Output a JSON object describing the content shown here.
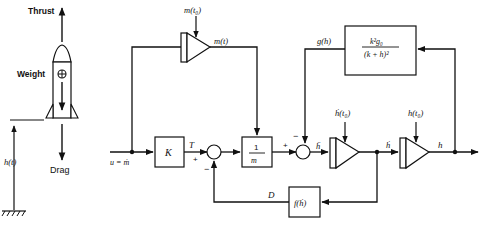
{
  "rocket": {
    "thrust_label": "Thrust",
    "weight_label": "Weight",
    "drag_label": "Drag",
    "height_label": "h(t)",
    "cg_symbol": "⊕"
  },
  "blocks": {
    "mass_integrator": {
      "ic_label": "m(t₀)",
      "output_label": "m(t)"
    },
    "gain_k": {
      "label": "K",
      "output_label": "T"
    },
    "inv_mass": {
      "numerator": "1",
      "denominator": "m"
    },
    "gravity": {
      "numerator": "k²g₀",
      "denominator": "(k + h)²",
      "output_label": "g(h)"
    },
    "velocity_integrator": {
      "ic_label": "ḣ(t₀)",
      "input_label": "ḧ",
      "output_label": "ḣ"
    },
    "height_integrator": {
      "ic_label": "h(t₀)",
      "output_label": "h"
    },
    "drag": {
      "label": "f(ḣ)",
      "output_label": "D"
    }
  },
  "input": {
    "label": "u = ṁ"
  },
  "summing_junctions": {
    "sum1": {
      "plus": "+",
      "minus": "−"
    },
    "sum2": {
      "plus": "+",
      "minus": "−"
    }
  },
  "colors": {
    "ink": "#111111",
    "background": "#ffffff"
  }
}
